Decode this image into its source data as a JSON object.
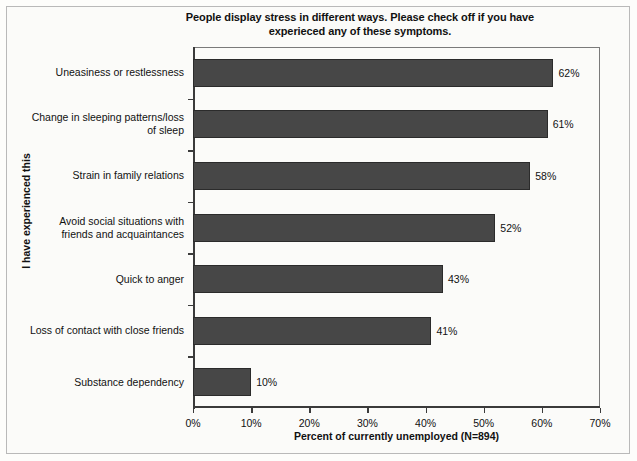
{
  "chart_data": {
    "type": "bar",
    "orientation": "horizontal",
    "title": "People display stress in different ways. Please check off if you have experieced any of these symptoms.",
    "title_line1": "People display stress in different ways. Please check off if you have",
    "title_line2": "experieced any of these symptoms.",
    "xlabel": "Percent of currently unemployed (N=894)",
    "ylabel": "I have experienced this",
    "categories": [
      "Uneasiness or restlessness",
      "Change in sleeping patterns/loss of sleep",
      "Strain in family relations",
      "Avoid social situations with friends and acquaintances",
      "Quick to anger",
      "Loss of contact with close friends",
      "Substance dependency"
    ],
    "category_lines": [
      [
        "Uneasiness or restlessness"
      ],
      [
        "Change in sleeping patterns/loss",
        "of sleep"
      ],
      [
        "Strain in family relations"
      ],
      [
        "Avoid social situations with",
        "friends and acquaintances"
      ],
      [
        "Quick to anger"
      ],
      [
        "Loss of contact with close friends"
      ],
      [
        "Substance dependency"
      ]
    ],
    "values": [
      62,
      61,
      58,
      52,
      43,
      41,
      10
    ],
    "data_labels": [
      "62%",
      "61%",
      "58%",
      "52%",
      "43%",
      "41%",
      "10%"
    ],
    "xlim": [
      0,
      70
    ],
    "xticks": [
      0,
      10,
      20,
      30,
      40,
      50,
      60,
      70
    ],
    "xtick_labels": [
      "0%",
      "10%",
      "20%",
      "30%",
      "40%",
      "50%",
      "60%",
      "70%"
    ],
    "grid": false,
    "legend": false,
    "bar_color": "#474747",
    "bar_edge_color": "#2b2b2b",
    "background_color": "#fbfbf9",
    "text_color": "#111111",
    "sample_size": 894
  }
}
